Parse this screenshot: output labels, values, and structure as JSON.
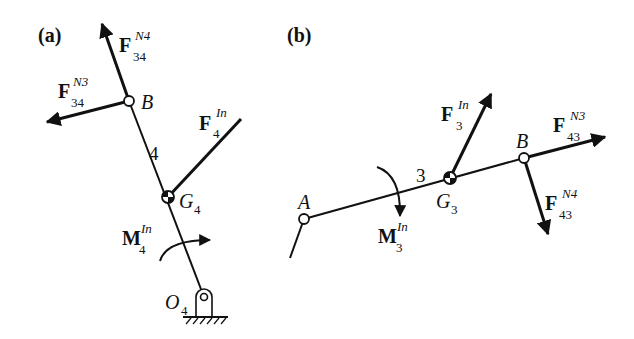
{
  "panels": {
    "a": {
      "label": "(a)",
      "link_number": "4",
      "points": {
        "B": "B",
        "G": "G",
        "G_sub": "4",
        "O": "O",
        "O_sub": "4"
      },
      "forces": [
        {
          "id": "F34N4",
          "symbol": "F",
          "sup": "N4",
          "sub": "34"
        },
        {
          "id": "F34N3",
          "symbol": "F",
          "sup": "N3",
          "sub": "34"
        },
        {
          "id": "F4In",
          "symbol": "F",
          "sup": "In",
          "sub": "4"
        }
      ],
      "moment": {
        "symbol": "M",
        "sup": "In",
        "sub": "4"
      }
    },
    "b": {
      "label": "(b)",
      "link_number": "3",
      "points": {
        "A": "A",
        "B": "B",
        "G": "G",
        "G_sub": "3"
      },
      "forces": [
        {
          "id": "F3In",
          "symbol": "F",
          "sup": "In",
          "sub": "3"
        },
        {
          "id": "F43N3",
          "symbol": "F",
          "sup": "N3",
          "sub": "43"
        },
        {
          "id": "F43N4",
          "symbol": "F",
          "sup": "N4",
          "sub": "43"
        }
      ],
      "moment": {
        "symbol": "M",
        "sup": "In",
        "sub": "3"
      }
    }
  },
  "colors": {
    "ink": "#111111",
    "background": "#ffffff"
  }
}
